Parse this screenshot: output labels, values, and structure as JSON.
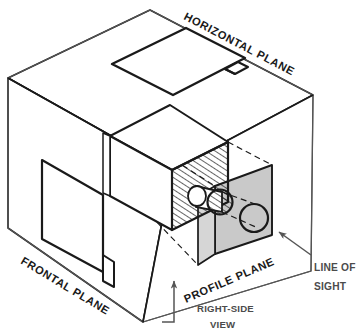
{
  "diagram": {
    "labels": {
      "horizontal_plane": "HORIZONTAL PLANE",
      "frontal_plane": "FRONTAL PLANE",
      "profile_plane": "PROFILE PLANE",
      "line_of_sight_1": "LINE OF",
      "line_of_sight_2": "SIGHT",
      "right_side_view_1": "RIGHT-SIDE",
      "right_side_view_2": "VIEW"
    },
    "colors": {
      "outline": "#1a1a1a",
      "thin_edge": "#555555",
      "profile_plane_fill": "#c9c9c9",
      "hatch_stroke": "#1a1a1a",
      "leader": "#555555",
      "background": "#ffffff",
      "text": "#1a1a1a",
      "callout_text": "#4b4b4b"
    },
    "elements": {
      "glass_box": "open transparent projection box",
      "object_block": "rectangular block with cylindrical boss",
      "top_view_outline": "horizontal plane projection of object",
      "front_view_outline": "frontal plane projection of object",
      "profile_view_outline": "shaded profile plane projection with circle",
      "projection_lines": "dashed projectors from object to profile plane",
      "hatched_face": "section-hatched right face of object",
      "cylinder": "cylindrical boss projecting toward profile plane",
      "circle_projection": "circular projection of boss on profile plane"
    }
  }
}
